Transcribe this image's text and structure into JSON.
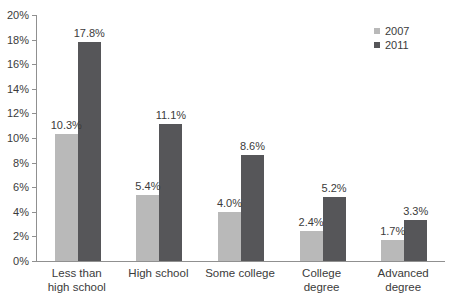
{
  "chart_style": {
    "background": "#ffffff",
    "axis_color": "#909090",
    "text_color": "#3b3b3b"
  },
  "legend": {
    "items": [
      {
        "label": "2007",
        "color": "#b9b9b9"
      },
      {
        "label": "2011",
        "color": "#565659"
      }
    ]
  },
  "chart_data": {
    "type": "bar",
    "title": "",
    "xlabel": "",
    "ylabel": "",
    "categories": [
      "Less than\nhigh school",
      "High school",
      "Some college",
      "College\ndegree",
      "Advanced\ndegree"
    ],
    "series": [
      {
        "name": "2007",
        "color": "#b9b9b9",
        "values": [
          10.3,
          5.4,
          4.0,
          2.4,
          1.7
        ],
        "value_labels": [
          "10.3%",
          "5.4%",
          "4.0%",
          "2.4%",
          "1.7%"
        ]
      },
      {
        "name": "2011",
        "color": "#565659",
        "values": [
          17.8,
          11.1,
          8.6,
          5.2,
          3.3
        ],
        "value_labels": [
          "17.8%",
          "11.1%",
          "8.6%",
          "5.2%",
          "3.3%"
        ]
      }
    ],
    "ylim": [
      0,
      20
    ],
    "ytick_step": 2,
    "ytick_labels": [
      "0%",
      "2%",
      "4%",
      "6%",
      "8%",
      "10%",
      "12%",
      "14%",
      "16%",
      "18%",
      "20%"
    ],
    "grid": false,
    "legend_position": "top-right"
  }
}
